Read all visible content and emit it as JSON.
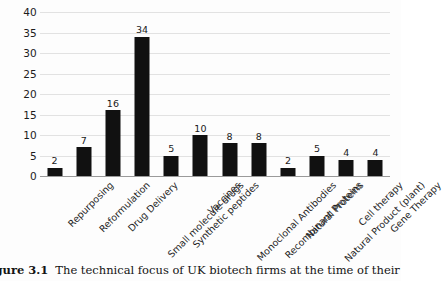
{
  "figure": {
    "caption_label": "Figure 3.1",
    "caption_text": "The technical focus of UK biotech firms at the time of their IPO*"
  },
  "colors": {
    "bar": "#111111",
    "gridline": "#e2e2e2",
    "axis": "#9a9a9a",
    "text": "#1c1c1c",
    "background": "#fdfdfd"
  },
  "chart_data": {
    "type": "bar",
    "title": "The technical focus of UK biotech firms at the time of their IPO*",
    "xlabel": "",
    "ylabel": "",
    "ylim": [
      0,
      40
    ],
    "yticks": [
      0,
      5,
      10,
      15,
      20,
      25,
      30,
      35,
      40
    ],
    "grid": true,
    "legend": false,
    "data_labels": true,
    "categories": [
      "Repurposing",
      "Reformulation",
      "Drug Delivery",
      "Small molecule drugs",
      "Synthetic peptides",
      "Vaccines",
      "Monoclonal Antibodies",
      "Recombinant Proteins",
      "Natural Proteins",
      "Natural Product (plant)",
      "Cell therapy",
      "Gene Therapy"
    ],
    "values": [
      2,
      7,
      16,
      34,
      5,
      10,
      8,
      8,
      2,
      5,
      4,
      4
    ]
  }
}
